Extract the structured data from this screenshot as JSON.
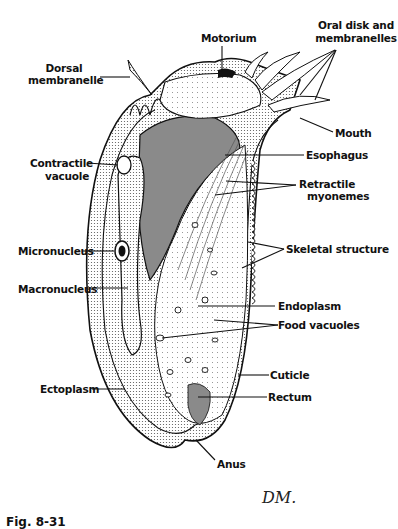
{
  "figure": {
    "caption": "Fig. 8-31",
    "signature": "DM."
  },
  "labels": {
    "motorium": "Motorium",
    "oral_disk_line1": "Oral disk and",
    "oral_disk_line2": "membranelles",
    "dorsal_line1": "Dorsal",
    "dorsal_line2": "membranelle",
    "mouth": "Mouth",
    "contractile_line1": "Contractile",
    "contractile_line2": "vacuole",
    "esophagus": "Esophagus",
    "retractile_line1": "Retractile",
    "retractile_line2": "myonemes",
    "micronucleus": "Micronucleus",
    "skeletal": "Skeletal structure",
    "macronucleus": "Macronucleus",
    "endoplasm": "Endoplasm",
    "food_vacuoles": "Food vacuoles",
    "cuticle": "Cuticle",
    "ectoplasm": "Ectoplasm",
    "rectum": "Rectum",
    "anus": "Anus"
  },
  "colors": {
    "ink": "#111111",
    "paper": "#ffffff",
    "stipple_dark": "#2a2a2a",
    "stipple_mid": "#8a8a8a",
    "stipple_light": "#d4d4d4"
  }
}
